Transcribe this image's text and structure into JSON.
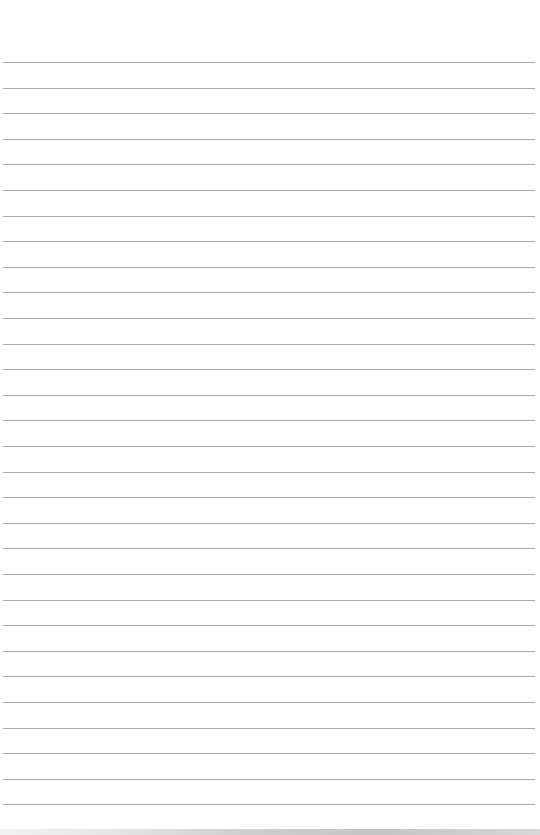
{
  "page": {
    "type": "lined-paper",
    "header_bleedthrough": [
      "",
      ""
    ],
    "rule_count": 30,
    "rule_start_y": 62,
    "rule_spacing": 25.6,
    "colors": {
      "paper": "#ffffff",
      "rule": "#a9a9a9"
    }
  }
}
